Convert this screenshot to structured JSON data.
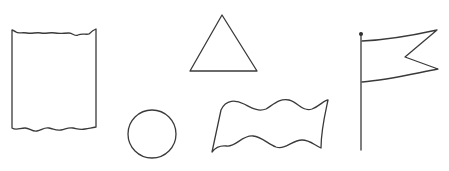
{
  "shapes": [
    {
      "id": "scroll-rectangle",
      "label": "wavy-edged rectangle (paper/scroll)"
    },
    {
      "id": "circle",
      "label": "circle"
    },
    {
      "id": "triangle",
      "label": "triangle"
    },
    {
      "id": "wavy-banner",
      "label": "wavy banner"
    },
    {
      "id": "pennant-flag",
      "label": "swallowtail flag on pole"
    }
  ],
  "colors": {
    "background": "#ffffff",
    "stroke": "#3a3a3a"
  }
}
